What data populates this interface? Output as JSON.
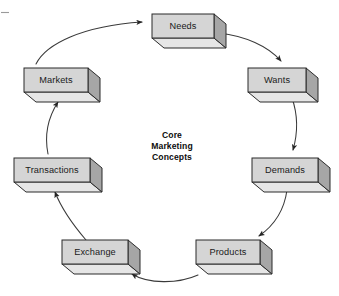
{
  "diagram": {
    "title": "Core Marketing Concepts",
    "center_label_lines": [
      "Core",
      "Marketing",
      "Concepts"
    ],
    "layout": "circular-cycle",
    "direction": "clockwise",
    "node_count": 7,
    "colors": {
      "box_front": "#d5d5d5",
      "box_side": "#a6a6a6",
      "box_bottom": "#e6e6e6",
      "outline": "#2b2b2b",
      "arrow": "#3a3a3a",
      "background": "#ffffff",
      "text": "#1a1a1a"
    },
    "nodes": [
      {
        "id": "needs",
        "label": "Needs",
        "x": 152,
        "y": 14,
        "w": 62,
        "h": 24
      },
      {
        "id": "wants",
        "label": "Wants",
        "x": 248,
        "y": 68,
        "w": 58,
        "h": 24
      },
      {
        "id": "demands",
        "label": "Demands",
        "x": 252,
        "y": 158,
        "w": 66,
        "h": 24
      },
      {
        "id": "products",
        "label": "Products",
        "x": 196,
        "y": 240,
        "w": 64,
        "h": 24
      },
      {
        "id": "exchange",
        "label": "Exchange",
        "x": 62,
        "y": 240,
        "w": 66,
        "h": 24
      },
      {
        "id": "transactions",
        "label": "Transactions",
        "x": 14,
        "y": 158,
        "w": 76,
        "h": 24
      },
      {
        "id": "markets",
        "label": "Markets",
        "x": 24,
        "y": 68,
        "w": 64,
        "h": 24
      }
    ],
    "edges": [
      {
        "from": "markets",
        "to": "needs",
        "label": ""
      },
      {
        "from": "needs",
        "to": "wants",
        "label": ""
      },
      {
        "from": "wants",
        "to": "demands",
        "label": ""
      },
      {
        "from": "demands",
        "to": "products",
        "label": ""
      },
      {
        "from": "products",
        "to": "exchange",
        "label": ""
      },
      {
        "from": "exchange",
        "to": "transactions",
        "label": ""
      },
      {
        "from": "transactions",
        "to": "markets",
        "label": ""
      }
    ]
  }
}
